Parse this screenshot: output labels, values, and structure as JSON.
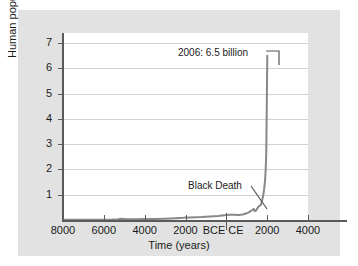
{
  "chart_data": {
    "type": "line",
    "title": "",
    "xlabel": "Time (years)",
    "ylabel": "Human population (billions)",
    "xlim": [
      -8000,
      4000
    ],
    "ylim": [
      0,
      7.4
    ],
    "grid": true,
    "legend": null,
    "y_ticks": [
      1,
      2,
      3,
      4,
      5,
      6,
      7
    ],
    "y_tick_labels": [
      "1",
      "2",
      "3",
      "4",
      "5",
      "6",
      "7"
    ],
    "x_ticks": [
      -8000,
      -6000,
      -4000,
      -2000,
      0,
      2000,
      4000
    ],
    "x_tick_labels": [
      "8000",
      "6000",
      "4000",
      "2000",
      "BCE",
      "CE",
      "2000",
      "4000"
    ],
    "era_divider_label_bce": "BCE",
    "era_divider_label_ce": "CE",
    "series": [
      {
        "name": "Human population",
        "color": "#888888",
        "x": [
          -8000,
          -7500,
          -7000,
          -6500,
          -6000,
          -5600,
          -5300,
          -5150,
          -5000,
          -4800,
          -4500,
          -4000,
          -3500,
          -3000,
          -2700,
          -2500,
          -2300,
          -2100,
          -2000,
          -1800,
          -1500,
          -1200,
          -1000,
          -800,
          -600,
          -400,
          -200,
          0,
          200,
          400,
          600,
          800,
          1000,
          1100,
          1200,
          1300,
          1340,
          1400,
          1450,
          1500,
          1600,
          1700,
          1750,
          1800,
          1850,
          1900,
          1927,
          1950,
          1960,
          1974,
          1987,
          1999,
          2006
        ],
        "y": [
          0.005,
          0.006,
          0.007,
          0.008,
          0.01,
          0.015,
          0.03,
          0.05,
          0.04,
          0.03,
          0.03,
          0.035,
          0.04,
          0.05,
          0.06,
          0.07,
          0.08,
          0.09,
          0.1,
          0.1,
          0.11,
          0.12,
          0.13,
          0.14,
          0.15,
          0.16,
          0.18,
          0.2,
          0.21,
          0.21,
          0.2,
          0.22,
          0.27,
          0.3,
          0.36,
          0.4,
          0.44,
          0.35,
          0.37,
          0.44,
          0.55,
          0.6,
          0.77,
          0.95,
          1.2,
          1.6,
          2.0,
          2.5,
          3.0,
          4.0,
          5.0,
          6.0,
          6.5
        ]
      }
    ],
    "annotations": [
      {
        "name": "peak-label",
        "text": "2006: 6.5 billion",
        "x": 2006,
        "y": 6.5
      },
      {
        "name": "black-death-label",
        "text": "Black Death",
        "x": 1350,
        "y": 0.37
      }
    ]
  }
}
